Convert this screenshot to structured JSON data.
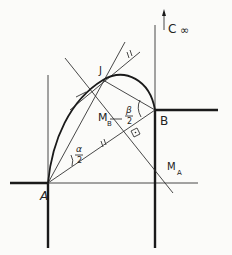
{
  "diagram": {
    "labels": {
      "A": "A",
      "B": "B",
      "J": "J",
      "M_B": "M",
      "M_B_sub": "B",
      "M_A": "M",
      "M_A_sub": "A",
      "alpha_num": "α",
      "alpha_den": "2",
      "beta_num": "β",
      "beta_den": "2",
      "C": "C",
      "infinity": "∞",
      "tick_parallel": "//"
    },
    "points": {
      "A": [
        48,
        183
      ],
      "B": [
        155,
        110
      ],
      "J": [
        103,
        80
      ]
    },
    "colors": {
      "ink": "#1a1a1a",
      "paper": "#fbfbf9"
    }
  }
}
